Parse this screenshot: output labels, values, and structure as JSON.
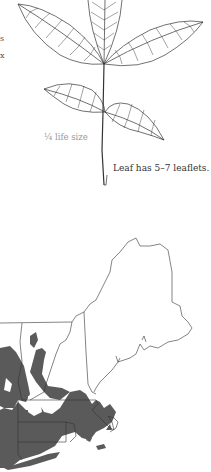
{
  "page": {
    "type": "field-guide-species-page"
  },
  "left_edge_fragments": [
    "s",
    "x"
  ],
  "leaf_illustration": {
    "description": "Palmately compound leaf line drawing with 5 leaflets",
    "scale_caption": "¼ life size",
    "leaflet_caption": "Leaf has 5–7 leaflets."
  },
  "range_map": {
    "region": "New England",
    "states_outlined": [
      "Maine",
      "New Hampshire",
      "Vermont",
      "Massachusetts",
      "Connecticut",
      "Rhode Island",
      "New York (partial)"
    ],
    "range_fill_color": "#5a5a5a",
    "outline_color": "#333333",
    "range_description": "Shaded range covers southern New England: Connecticut, Rhode Island, most of Massachusetts, southern Vermont/New Hampshire edges, eastern New York and Long Island"
  }
}
